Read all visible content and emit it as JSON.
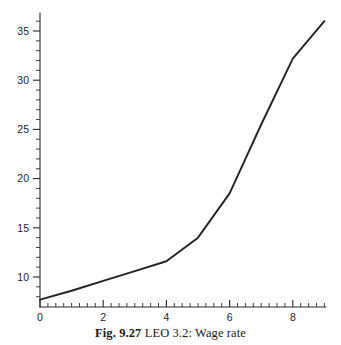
{
  "caption": {
    "figure_number": "Fig. 9.27",
    "text": "LEO 3.2: Wage rate"
  },
  "chart_data": {
    "type": "line",
    "title": "",
    "subtitle": "",
    "xlabel": "",
    "ylabel": "",
    "x": [
      0,
      1,
      2,
      3,
      4,
      5,
      6,
      7,
      8,
      9
    ],
    "values": [
      7.7,
      8.6,
      9.6,
      10.6,
      11.6,
      14.0,
      18.5,
      25.5,
      32.2,
      36.0
    ],
    "series": [
      {
        "name": "Wage rate",
        "values": [
          7.7,
          8.6,
          9.6,
          10.6,
          11.6,
          14.0,
          18.5,
          25.5,
          32.2,
          36.0
        ]
      }
    ],
    "xlim": [
      0,
      9
    ],
    "ylim": [
      7.2,
      36.6
    ],
    "x_ticks": [
      0,
      2,
      4,
      6,
      8
    ],
    "x_tick_labels": [
      "0",
      "2",
      "4",
      "6",
      "8"
    ],
    "x_minor_step": 0.25,
    "y_ticks": [
      10,
      15,
      20,
      25,
      30,
      35
    ],
    "y_tick_labels": [
      "10",
      "15",
      "20",
      "25",
      "30",
      "35"
    ],
    "y_minor_step": 1,
    "grid": false,
    "legend": "none",
    "line_color": "#232323",
    "axis_color": "#2a2a2a",
    "background_color": "#ffffff",
    "annotations": []
  }
}
